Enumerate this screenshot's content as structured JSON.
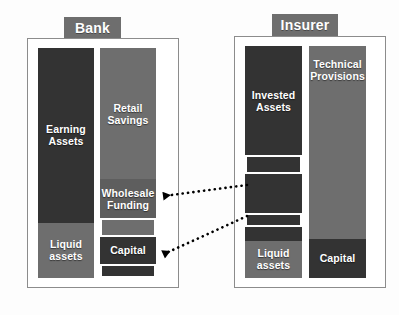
{
  "diagram": {
    "background": "#ffffff",
    "colors": {
      "dark": "#333333",
      "mid_dark": "#3a3a3a",
      "mid": "#6e6e6e",
      "light_mid": "#7b7b7b",
      "wholesale": "#5e5e5e",
      "frame": "#8c8c8c",
      "tab": "#6e6e6e",
      "outline": "#ffffff",
      "arrow": "#000000"
    }
  },
  "entities": [
    {
      "key": "bank",
      "tab_label": "Bank",
      "assets": {
        "column_name": "bank-assets-column",
        "segments": [
          {
            "key": "earning-assets",
            "label": "Earning\nAssets",
            "color": "#333333",
            "height_pct": 76,
            "show_label": true
          },
          {
            "key": "liquid-assets",
            "label": "Liquid\nassets",
            "color": "#6e6e6e",
            "height_pct": 24,
            "show_label": true
          }
        ]
      },
      "liabilities": {
        "column_name": "bank-liabilities-column",
        "segments": [
          {
            "key": "retail-savings",
            "label": "Retail\nSavings",
            "color": "#6e6e6e",
            "height_pct": 57,
            "show_label": true
          },
          {
            "key": "wholesale-funding",
            "label": "Wholesale\nFunding",
            "color": "#5e5e5e",
            "height_pct": 17,
            "show_label": true
          },
          {
            "key": "wholesale-funding-highlight",
            "label": "",
            "color": "#6e6e6e",
            "height_pct": 8,
            "show_label": false,
            "outlined": true
          },
          {
            "key": "capital",
            "label": "Capital",
            "color": "#333333",
            "height_pct": 12,
            "show_label": true
          },
          {
            "key": "capital-highlight",
            "label": "",
            "color": "#333333",
            "height_pct": 6,
            "show_label": false,
            "outlined": true
          }
        ]
      }
    },
    {
      "key": "insurer",
      "tab_label": "Insurer",
      "assets": {
        "column_name": "insurer-assets-column",
        "segments": [
          {
            "key": "invested-assets",
            "label": "Invested\nAssets",
            "color": "#333333",
            "height_pct": 47,
            "show_label": true
          },
          {
            "key": "invested-assets-highlight-upper",
            "label": "",
            "color": "#333333",
            "height_pct": 8,
            "show_label": false,
            "outlined": true
          },
          {
            "key": "invested-assets-mid",
            "label": "",
            "color": "#333333",
            "height_pct": 17,
            "show_label": false
          },
          {
            "key": "invested-assets-highlight-lower",
            "label": "",
            "color": "#333333",
            "height_pct": 6,
            "show_label": false,
            "outlined": true
          },
          {
            "key": "invested-assets-lower",
            "label": "",
            "color": "#333333",
            "height_pct": 6,
            "show_label": false
          },
          {
            "key": "liquid-assets",
            "label": "Liquid\nassets",
            "color": "#6e6e6e",
            "height_pct": 16,
            "show_label": true
          }
        ]
      },
      "liabilities": {
        "column_name": "insurer-liabilities-column",
        "segments": [
          {
            "key": "technical-provisions",
            "label": "Technical\nProvisions",
            "color": "#6e6e6e",
            "height_pct": 83,
            "show_label": true
          },
          {
            "key": "capital",
            "label": "Capital",
            "color": "#333333",
            "height_pct": 17,
            "show_label": true
          }
        ]
      }
    }
  ],
  "arrows": [
    {
      "key": "arrow-insurer-to-bank-wholesale",
      "style": "dotted",
      "from": "insurer-invested-assets-highlight-upper",
      "to": "bank-wholesale-funding-highlight",
      "head": "left"
    },
    {
      "key": "arrow-insurer-to-bank-capital",
      "style": "dotted",
      "from": "insurer-invested-assets-highlight-lower",
      "to": "bank-capital-highlight",
      "head": "left"
    }
  ]
}
